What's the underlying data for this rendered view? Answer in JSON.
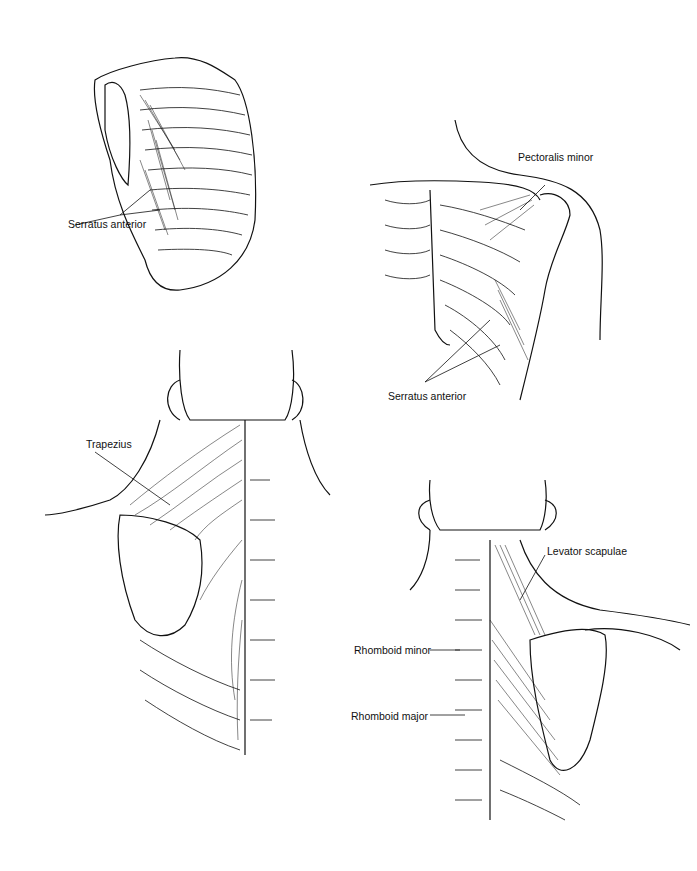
{
  "figures": [
    {
      "id": "lateral-thorax",
      "labels": [
        {
          "text": "Serratus anterior"
        }
      ]
    },
    {
      "id": "anterior-thorax",
      "labels": [
        {
          "text": "Pectoralis minor"
        },
        {
          "text": "Serratus anterior"
        }
      ]
    },
    {
      "id": "posterior-neck-superficial",
      "labels": [
        {
          "text": "Trapezius"
        }
      ]
    },
    {
      "id": "posterior-neck-deep",
      "labels": [
        {
          "text": "Levator scapulae"
        },
        {
          "text": "Rhomboid minor"
        },
        {
          "text": "Rhomboid major"
        }
      ]
    }
  ],
  "colors": {
    "ink": "#111111",
    "background": "#ffffff"
  }
}
